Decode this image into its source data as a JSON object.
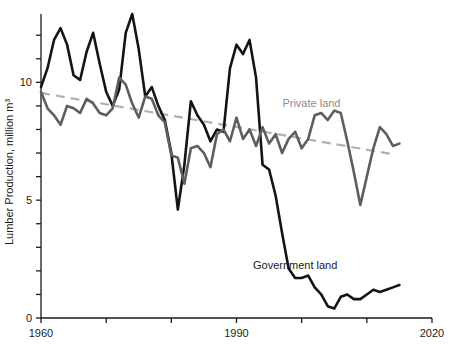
{
  "chart_data": {
    "type": "line",
    "title": "",
    "xlabel": "",
    "ylabel": "Lumber Production, million m³",
    "xlim": [
      1960,
      2020
    ],
    "ylim": [
      0,
      12.9
    ],
    "xticks": [
      1960,
      1970,
      1980,
      1990,
      2000,
      2010,
      2020
    ],
    "xticklabels": [
      "1960",
      "",
      "",
      "1990",
      "",
      "",
      "2020"
    ],
    "yticks": [
      0,
      1,
      2,
      3,
      4,
      5,
      6,
      7,
      8,
      9,
      10,
      11,
      12
    ],
    "yticklabels": [
      "0",
      "",
      "",
      "",
      "",
      "5",
      "",
      "",
      "",
      "",
      "10",
      "",
      ""
    ],
    "grid": false,
    "legend_position": "inline-annotations",
    "annotations": [
      {
        "text": "Private land",
        "x": 2001.5,
        "y": 8.95,
        "color": "#8c8c8c"
      },
      {
        "text": "Government land",
        "x": 1999.0,
        "y": 2.1,
        "color": "#1a1a1a"
      }
    ],
    "series": [
      {
        "name": "Government land",
        "color": "#141414",
        "linewidth": 2.6,
        "style": "solid",
        "x": [
          1960,
          1961,
          1962,
          1963,
          1964,
          1965,
          1966,
          1967,
          1968,
          1969,
          1970,
          1971,
          1972,
          1973,
          1974,
          1975,
          1976,
          1977,
          1978,
          1979,
          1980,
          1981,
          1982,
          1983,
          1984,
          1985,
          1986,
          1987,
          1988,
          1989,
          1990,
          1991,
          1992,
          1993,
          1994,
          1995,
          1996,
          1997,
          1998,
          1999,
          2000,
          2001,
          2002,
          2003,
          2004,
          2005,
          2006,
          2007,
          2008,
          2009,
          2010,
          2011,
          2012,
          2013,
          2014,
          2015
        ],
        "values": [
          9.8,
          10.6,
          11.8,
          12.3,
          11.6,
          10.3,
          10.1,
          11.3,
          12.1,
          10.8,
          9.6,
          9.0,
          9.7,
          12.1,
          12.9,
          11.4,
          9.4,
          9.8,
          9.0,
          8.4,
          7.0,
          4.6,
          6.5,
          9.2,
          8.6,
          8.2,
          7.5,
          8.0,
          7.9,
          10.6,
          11.6,
          11.2,
          11.8,
          10.2,
          6.5,
          6.3,
          5.2,
          3.6,
          2.1,
          1.7,
          1.7,
          1.8,
          1.3,
          1.0,
          0.5,
          0.4,
          0.9,
          1.0,
          0.8,
          0.8,
          1.0,
          1.2,
          1.1,
          1.2,
          1.3,
          1.4
        ]
      },
      {
        "name": "Private land",
        "color": "#5e5e5e",
        "linewidth": 2.6,
        "style": "solid",
        "x": [
          1960,
          1961,
          1962,
          1963,
          1964,
          1965,
          1966,
          1967,
          1968,
          1969,
          1970,
          1971,
          1972,
          1973,
          1974,
          1975,
          1976,
          1977,
          1978,
          1979,
          1980,
          1981,
          1982,
          1983,
          1984,
          1985,
          1986,
          1987,
          1988,
          1989,
          1990,
          1991,
          1992,
          1993,
          1994,
          1995,
          1996,
          1997,
          1998,
          1999,
          2000,
          2001,
          2002,
          2003,
          2004,
          2005,
          2006,
          2007,
          2008,
          2009,
          2010,
          2011,
          2012,
          2013,
          2014,
          2015
        ],
        "values": [
          9.6,
          8.9,
          8.6,
          8.2,
          9.0,
          8.9,
          8.7,
          9.3,
          9.1,
          8.7,
          8.6,
          8.9,
          10.2,
          9.9,
          9.1,
          8.5,
          9.4,
          9.3,
          8.6,
          8.3,
          6.9,
          6.8,
          5.7,
          7.2,
          7.3,
          7.0,
          6.4,
          7.8,
          8.0,
          7.5,
          8.5,
          7.6,
          8.0,
          7.3,
          8.1,
          7.4,
          7.8,
          7.0,
          7.6,
          7.9,
          7.2,
          7.6,
          8.6,
          8.7,
          8.4,
          8.8,
          8.7,
          7.5,
          6.2,
          4.8,
          6.0,
          7.2,
          8.1,
          7.8,
          7.3,
          7.4
        ]
      }
    ],
    "trendlines": [
      {
        "name": "Private land trend",
        "color": "#b0b0b0",
        "style": "dashed",
        "linewidth": 2.2,
        "x": [
          1960,
          2014
        ],
        "values": [
          9.55,
          6.95
        ]
      }
    ]
  }
}
